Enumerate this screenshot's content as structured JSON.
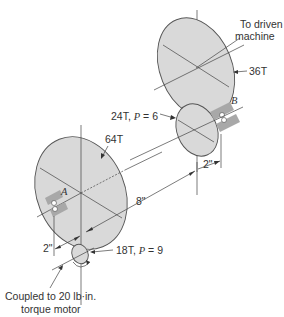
{
  "diagram": {
    "type": "gear-train",
    "colors": {
      "gear_fill": "#d9d9d9",
      "outline": "#555555",
      "bearing": "#a8a8a8",
      "text": "#333333"
    },
    "labels": {
      "driven_line1": "To driven",
      "driven_line2": "machine",
      "gear_36": "36T",
      "gear_24": "24T, ",
      "gear_24_p": "P",
      "gear_24_pval": " = 6",
      "gear_64": "64T",
      "gear_18": "18T, ",
      "gear_18_p": "P",
      "gear_18_pval": " = 9",
      "bearing_a": "A",
      "bearing_b": "B",
      "dim_8": "8\"",
      "dim_2_left": "2\"",
      "dim_2_right": "2\"",
      "motor_line1": "Coupled to 20 lb·in.",
      "motor_line2": "torque motor"
    },
    "gears": [
      {
        "name": "36T",
        "teeth": 36
      },
      {
        "name": "24T",
        "teeth": 24,
        "P": 6
      },
      {
        "name": "64T",
        "teeth": 64
      },
      {
        "name": "18T",
        "teeth": 18,
        "P": 9
      }
    ],
    "dimensions": {
      "shaft_spacing": "8\"",
      "left_offset": "2\"",
      "right_offset": "2\""
    },
    "input_torque": "20 lb·in."
  }
}
